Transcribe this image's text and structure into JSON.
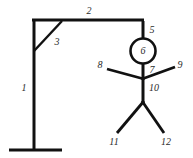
{
  "diagram": {
    "type": "line-drawing",
    "stroke_color": "#111111",
    "label_color": "#2b2b2b",
    "background_color": "#ffffff",
    "width": 193,
    "height": 158,
    "labels": [
      {
        "id": "1",
        "text": "1",
        "x": 24,
        "y": 88,
        "part": "vertical-post"
      },
      {
        "id": "2",
        "text": "2",
        "x": 89,
        "y": 11,
        "part": "horizontal-beam"
      },
      {
        "id": "3",
        "text": "3",
        "x": 57,
        "y": 42,
        "part": "diagonal-brace"
      },
      {
        "id": "5",
        "text": "5",
        "x": 152,
        "y": 30,
        "part": "rope"
      },
      {
        "id": "6",
        "text": "6",
        "x": 143,
        "y": 51,
        "part": "head"
      },
      {
        "id": "7",
        "text": "7",
        "x": 152,
        "y": 70,
        "part": "neck"
      },
      {
        "id": "8",
        "text": "8",
        "x": 100,
        "y": 65,
        "part": "left-arm"
      },
      {
        "id": "9",
        "text": "9",
        "x": 180,
        "y": 65,
        "part": "right-arm"
      },
      {
        "id": "10",
        "text": "10",
        "x": 154,
        "y": 88,
        "part": "torso"
      },
      {
        "id": "11",
        "text": "11",
        "x": 114,
        "y": 142,
        "part": "left-leg"
      },
      {
        "id": "12",
        "text": "12",
        "x": 166,
        "y": 142,
        "part": "right-leg"
      }
    ],
    "strokes": [
      {
        "part": "vertical-post",
        "x1": 34,
        "y1": 20,
        "x2": 34,
        "y2": 150,
        "width": 3
      },
      {
        "part": "base-foot",
        "x1": 9,
        "y1": 150,
        "x2": 62,
        "y2": 150,
        "width": 3
      },
      {
        "part": "horizontal-beam",
        "x1": 33,
        "y1": 20,
        "x2": 144,
        "y2": 20,
        "width": 3
      },
      {
        "part": "diagonal-brace",
        "x1": 62,
        "y1": 21,
        "x2": 34,
        "y2": 51,
        "width": 2.4
      },
      {
        "part": "rope",
        "x1": 143,
        "y1": 21,
        "x2": 143,
        "y2": 38,
        "width": 3
      },
      {
        "part": "neck",
        "x1": 143,
        "y1": 62,
        "x2": 143,
        "y2": 79,
        "width": 3
      },
      {
        "part": "torso",
        "x1": 143,
        "y1": 78,
        "x2": 143,
        "y2": 103,
        "width": 3
      },
      {
        "part": "left-arm",
        "x1": 143,
        "y1": 79,
        "x2": 107,
        "y2": 69,
        "width": 2.8
      },
      {
        "part": "right-arm",
        "x1": 143,
        "y1": 79,
        "x2": 175,
        "y2": 67,
        "width": 2.8
      },
      {
        "part": "left-leg",
        "x1": 143,
        "y1": 102,
        "x2": 117,
        "y2": 133,
        "width": 2.8
      },
      {
        "part": "right-leg",
        "x1": 143,
        "y1": 102,
        "x2": 164,
        "y2": 133,
        "width": 2.8
      }
    ],
    "head_circle": {
      "cx": 143,
      "cy": 51,
      "r": 12.5,
      "stroke_width": 2.6
    }
  }
}
